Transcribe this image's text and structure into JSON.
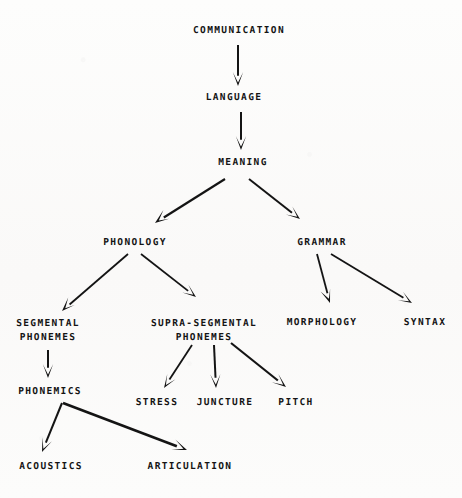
{
  "diagram": {
    "background_color": "#fbfbfa",
    "ink_color": "#141414",
    "nodes": [
      {
        "id": "communication",
        "label": "COMMUNICATION",
        "label_line2": "",
        "x": 239,
        "y": 31
      },
      {
        "id": "language",
        "label": "LANGUAGE",
        "label_line2": "",
        "x": 234,
        "y": 98
      },
      {
        "id": "meaning",
        "label": "MEANING",
        "label_line2": "",
        "x": 243,
        "y": 163
      },
      {
        "id": "phonology",
        "label": "PHONOLOGY",
        "label_line2": "",
        "x": 135,
        "y": 243
      },
      {
        "id": "grammar",
        "label": "GRAMMAR",
        "label_line2": "",
        "x": 322,
        "y": 243
      },
      {
        "id": "segmental-phonemes",
        "label": "SEGMENTAL",
        "label_line2": "PHONEMES",
        "x": 48,
        "y": 330
      },
      {
        "id": "supra-segmental-phonemes",
        "label": "SUPRA-SEGMENTAL",
        "label_line2": "PHONEMES",
        "x": 204,
        "y": 330
      },
      {
        "id": "morphology",
        "label": "MORPHOLOGY",
        "label_line2": "",
        "x": 322,
        "y": 323
      },
      {
        "id": "syntax",
        "label": "SYNTAX",
        "label_line2": "",
        "x": 425,
        "y": 323
      },
      {
        "id": "phonemics",
        "label": "PHONEMICS",
        "label_line2": "",
        "x": 50,
        "y": 392
      },
      {
        "id": "stress",
        "label": "STRESS",
        "label_line2": "",
        "x": 157,
        "y": 403
      },
      {
        "id": "juncture",
        "label": "JUNCTURE",
        "label_line2": "",
        "x": 225,
        "y": 403
      },
      {
        "id": "pitch",
        "label": "PITCH",
        "label_line2": "",
        "x": 296,
        "y": 403
      },
      {
        "id": "acoustics",
        "label": "ACOUSTICS",
        "label_line2": "",
        "x": 51,
        "y": 467
      },
      {
        "id": "articulation",
        "label": "ARTICULATION",
        "label_line2": "",
        "x": 190,
        "y": 467
      }
    ],
    "edges": [
      {
        "id": "communication-to-language",
        "from": "communication",
        "to": "language",
        "x1": 238,
        "y1": 45,
        "x2": 238,
        "y2": 86,
        "width": 2.0,
        "head": "plain"
      },
      {
        "id": "language-to-meaning",
        "from": "language",
        "to": "meaning",
        "x1": 241,
        "y1": 112,
        "x2": 241,
        "y2": 150,
        "width": 2.0,
        "head": "plain"
      },
      {
        "id": "meaning-to-phonology",
        "from": "meaning",
        "to": "phonology",
        "x1": 225,
        "y1": 179,
        "x2": 155,
        "y2": 223,
        "width": 2.2,
        "head": "barbed"
      },
      {
        "id": "meaning-to-grammar",
        "from": "meaning",
        "to": "grammar",
        "x1": 249,
        "y1": 179,
        "x2": 300,
        "y2": 219,
        "width": 2.0,
        "head": "plain"
      },
      {
        "id": "phonology-to-segmental",
        "from": "phonology",
        "to": "segmental-phonemes",
        "x1": 128,
        "y1": 254,
        "x2": 62,
        "y2": 311,
        "width": 1.8,
        "head": "barbed"
      },
      {
        "id": "phonology-to-supra-segmental",
        "from": "phonology",
        "to": "supra-segmental-phonemes",
        "x1": 141,
        "y1": 254,
        "x2": 196,
        "y2": 297,
        "width": 1.8,
        "head": "plain"
      },
      {
        "id": "grammar-to-morphology",
        "from": "grammar",
        "to": "morphology",
        "x1": 317,
        "y1": 254,
        "x2": 330,
        "y2": 303,
        "width": 1.8,
        "head": "barbed"
      },
      {
        "id": "grammar-to-syntax",
        "from": "grammar",
        "to": "syntax",
        "x1": 331,
        "y1": 254,
        "x2": 412,
        "y2": 303,
        "width": 1.8,
        "head": "plain"
      },
      {
        "id": "segmental-to-phonemics",
        "from": "segmental-phonemes",
        "to": "phonemics",
        "x1": 48,
        "y1": 350,
        "x2": 48,
        "y2": 378,
        "width": 2.0,
        "head": "plain"
      },
      {
        "id": "supra-segmental-to-stress",
        "from": "supra-segmental-phonemes",
        "to": "stress",
        "x1": 192,
        "y1": 345,
        "x2": 164,
        "y2": 388,
        "width": 1.8,
        "head": "plain"
      },
      {
        "id": "supra-segmental-to-juncture",
        "from": "supra-segmental-phonemes",
        "to": "juncture",
        "x1": 214,
        "y1": 345,
        "x2": 216,
        "y2": 388,
        "width": 2.0,
        "head": "plain"
      },
      {
        "id": "supra-segmental-to-pitch",
        "from": "supra-segmental-phonemes",
        "to": "pitch",
        "x1": 231,
        "y1": 343,
        "x2": 286,
        "y2": 387,
        "width": 2.2,
        "head": "plain"
      },
      {
        "id": "phonemics-to-acoustics",
        "from": "phonemics",
        "to": "acoustics",
        "x1": 62,
        "y1": 403,
        "x2": 42,
        "y2": 452,
        "width": 2.0,
        "head": "plain"
      },
      {
        "id": "phonemics-to-articulation",
        "from": "phonemics",
        "to": "articulation",
        "x1": 63,
        "y1": 403,
        "x2": 187,
        "y2": 450,
        "width": 2.6,
        "head": "plain"
      }
    ]
  }
}
